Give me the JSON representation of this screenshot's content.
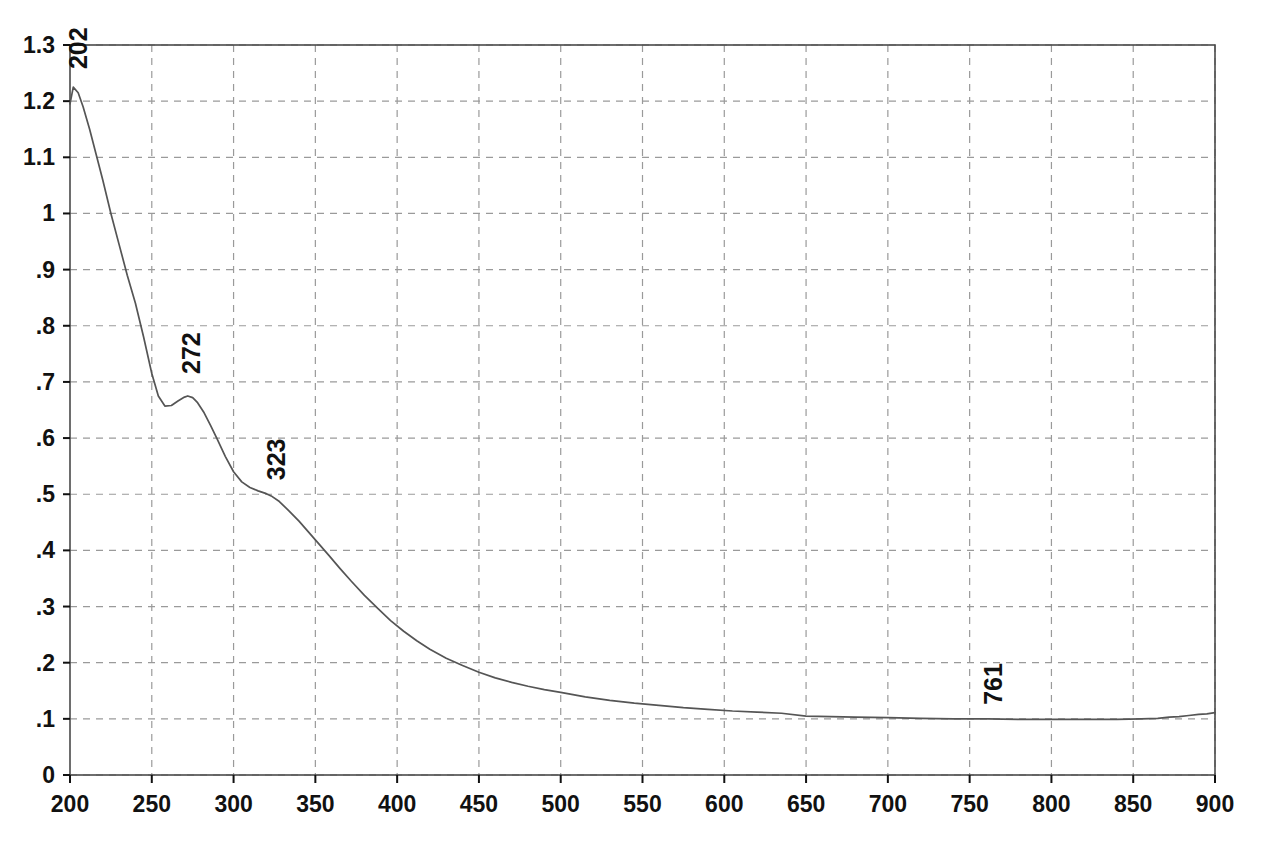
{
  "chart_data": {
    "type": "line",
    "title": "",
    "subtitle": "",
    "xlabel": "",
    "ylabel": "",
    "xlim": [
      200,
      900
    ],
    "ylim": [
      0,
      1.3
    ],
    "grid": true,
    "legend": false,
    "legend_position": "none",
    "x_ticks": [
      200,
      250,
      300,
      350,
      400,
      450,
      500,
      550,
      600,
      650,
      700,
      750,
      800,
      850,
      900
    ],
    "x_tick_labels": [
      "200",
      "250",
      "300",
      "350",
      "400",
      "450",
      "500",
      "550",
      "600",
      "650",
      "700",
      "750",
      "800",
      "850",
      "900"
    ],
    "y_ticks": [
      0,
      0.1,
      0.2,
      0.3,
      0.4,
      0.5,
      0.6,
      0.7,
      0.8,
      0.9,
      1.0,
      1.1,
      1.2,
      1.3
    ],
    "y_tick_labels": [
      "0",
      ".1",
      ".2",
      ".3",
      ".4",
      ".5",
      ".6",
      ".7",
      ".8",
      ".9",
      "1",
      "1.1",
      "1.2",
      "1.3"
    ],
    "line_color": "#555555",
    "grid_color": "#9a9a9a",
    "axis_color": "#4a4a4a",
    "annotations": [
      {
        "label": "202",
        "x": 202,
        "y": 1.225,
        "rotation": -90
      },
      {
        "label": "272",
        "x": 272,
        "y": 0.675,
        "rotation": -90
      },
      {
        "label": "323",
        "x": 323,
        "y": 0.5,
        "rotation": -90
      },
      {
        "label": "761",
        "x": 761,
        "y": 0.1,
        "rotation": -90
      }
    ],
    "series": [
      {
        "name": "absorbance",
        "x": [
          200,
          202,
          205,
          208,
          212,
          216,
          220,
          225,
          230,
          235,
          240,
          245,
          250,
          254,
          258,
          262,
          266,
          270,
          272,
          275,
          278,
          282,
          286,
          290,
          295,
          300,
          305,
          310,
          315,
          320,
          323,
          328,
          334,
          340,
          346,
          352,
          358,
          365,
          372,
          380,
          388,
          396,
          404,
          412,
          420,
          430,
          440,
          450,
          460,
          470,
          480,
          490,
          500,
          515,
          530,
          545,
          560,
          575,
          590,
          605,
          620,
          635,
          650,
          665,
          680,
          700,
          720,
          740,
          761,
          780,
          800,
          820,
          840,
          855,
          865,
          872,
          878,
          884,
          890,
          895,
          900
        ],
        "y": [
          1.195,
          1.225,
          1.215,
          1.19,
          1.15,
          1.105,
          1.06,
          1.0,
          0.945,
          0.89,
          0.84,
          0.78,
          0.715,
          0.675,
          0.657,
          0.658,
          0.666,
          0.673,
          0.675,
          0.672,
          0.663,
          0.645,
          0.622,
          0.598,
          0.567,
          0.54,
          0.522,
          0.512,
          0.506,
          0.501,
          0.497,
          0.487,
          0.47,
          0.452,
          0.432,
          0.412,
          0.392,
          0.368,
          0.345,
          0.32,
          0.297,
          0.275,
          0.256,
          0.239,
          0.224,
          0.208,
          0.195,
          0.183,
          0.173,
          0.165,
          0.158,
          0.152,
          0.147,
          0.139,
          0.133,
          0.128,
          0.124,
          0.12,
          0.117,
          0.114,
          0.112,
          0.11,
          0.105,
          0.104,
          0.103,
          0.102,
          0.101,
          0.1,
          0.1,
          0.099,
          0.099,
          0.099,
          0.099,
          0.1,
          0.101,
          0.103,
          0.104,
          0.106,
          0.108,
          0.109,
          0.111
        ]
      }
    ]
  }
}
